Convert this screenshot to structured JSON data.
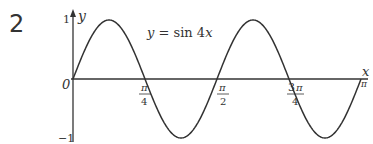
{
  "question_number": "2",
  "chart_data": {
    "type": "line",
    "title": "y = sin 4x",
    "xlabel": "x",
    "ylabel": "y",
    "xlim": [
      0,
      3.14159
    ],
    "ylim": [
      -1,
      1
    ],
    "x_ticks": [
      "π/4",
      "π/2",
      "3π/4",
      "π"
    ],
    "y_ticks": [
      "1",
      "-1"
    ],
    "origin_label": "0",
    "series": [
      {
        "name": "y = sin 4x",
        "x": [
          0,
          0.3927,
          0.7854,
          1.1781,
          1.5708,
          1.9635,
          2.3562,
          2.7489,
          3.1416
        ],
        "values": [
          0,
          1,
          0,
          -1,
          0,
          1,
          0,
          -1,
          0
        ]
      }
    ],
    "grid": false,
    "legend": "inline label"
  },
  "labels": {
    "equation_y": "y",
    "equation_rest": " = sin 4",
    "equation_x": "x",
    "axis_y": "y",
    "axis_x": "x",
    "y_max": "1",
    "y_min": "−1",
    "origin": "0",
    "pi": "π",
    "tick_4": "4",
    "tick_2": "2",
    "tick_3": "3"
  }
}
